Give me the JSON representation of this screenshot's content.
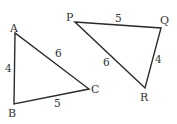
{
  "diagram": {
    "type": "geometry-triangles",
    "triangles": [
      {
        "name": "ABC",
        "vertices": {
          "A": "A",
          "B": "B",
          "C": "C"
        },
        "sides": {
          "AB": "4",
          "BC": "5",
          "AC": "6"
        }
      },
      {
        "name": "PQR",
        "vertices": {
          "P": "P",
          "Q": "Q",
          "R": "R"
        },
        "sides": {
          "PQ": "5",
          "QR": "4",
          "PR": "6"
        }
      }
    ],
    "colors": {
      "stroke": "#2b2b2b",
      "text": "#333333",
      "background": "#ffffff"
    }
  }
}
